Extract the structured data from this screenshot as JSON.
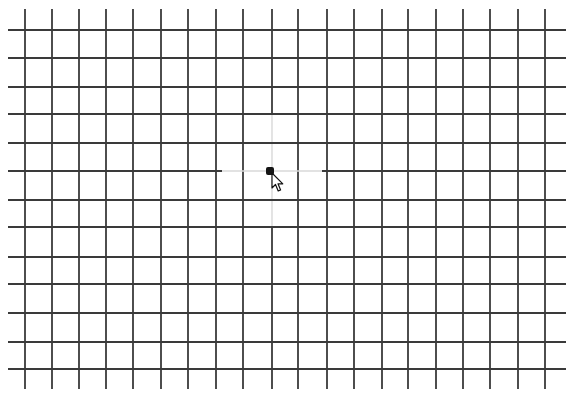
{
  "canvas": {
    "width": 575,
    "height": 412,
    "background": "#ffffff"
  },
  "grid": {
    "line_color": "#3a3a3a",
    "faint_color": "#d8d8d8",
    "vertical_lines_x": [
      25,
      52,
      79,
      106,
      133,
      161,
      188,
      216,
      243,
      272,
      298,
      327,
      354,
      382,
      408,
      436,
      463,
      490,
      518,
      545
    ],
    "vertical_extent_y": [
      9,
      389
    ],
    "horizontal_lines_y": [
      30,
      58,
      87,
      114,
      143,
      171,
      200,
      227,
      257,
      284,
      313,
      342,
      369
    ],
    "horizontal_extent_x": [
      8,
      566
    ],
    "center_vertical": {
      "x": 272,
      "faint_from_y": 115,
      "faint_to_y": 227
    },
    "center_horizontal": {
      "y": 171,
      "faint_from_x": 222,
      "faint_to_x": 322
    }
  },
  "fixation_dot": {
    "x": 270,
    "y": 171,
    "size": 8,
    "color": "#151515"
  },
  "cursor": {
    "type": "arrow-pointer",
    "tip_x": 272,
    "tip_y": 173
  }
}
